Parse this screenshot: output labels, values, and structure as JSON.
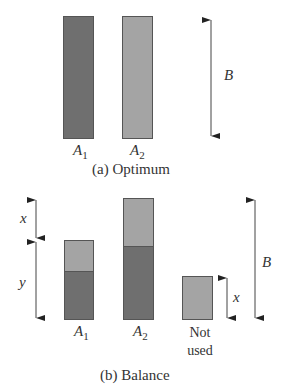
{
  "panel_a": {
    "caption": "(a) Optimum",
    "bars": [
      {
        "label_letter": "A",
        "label_sub": "1",
        "color": "#6f6f6f"
      },
      {
        "label_letter": "A",
        "label_sub": "2",
        "color": "#a4a4a4"
      }
    ],
    "dimension_label": "B"
  },
  "panel_b": {
    "caption": "(b) Balance",
    "bars": [
      {
        "label_letter": "A",
        "label_sub": "1"
      },
      {
        "label_letter": "A",
        "label_sub": "2"
      }
    ],
    "not_used_line1": "Not",
    "not_used_line2": "used",
    "left_dim_top": "x",
    "left_dim_bottom": "y",
    "small_dim": "x",
    "right_dim": "B"
  },
  "colors": {
    "dark": "#6f6f6f",
    "light": "#a4a4a4",
    "border": "#555555"
  }
}
